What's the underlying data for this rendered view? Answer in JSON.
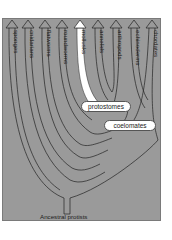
{
  "diagram": {
    "type": "phylogenetic-tree",
    "background_color": "#9a9a9a",
    "highlight_color": "#ffffff",
    "root_label": "Ancestral protists",
    "taxa": [
      {
        "name": "sponges",
        "x": 12,
        "highlighted": false
      },
      {
        "name": "cnidarians",
        "x": 28,
        "highlighted": false
      },
      {
        "name": "flatworms",
        "x": 45,
        "highlighted": false
      },
      {
        "name": "roundworms",
        "x": 62,
        "highlighted": false
      },
      {
        "name": "mollusks",
        "x": 80,
        "highlighted": true
      },
      {
        "name": "annelids",
        "x": 98,
        "highlighted": false
      },
      {
        "name": "arthropods",
        "x": 116,
        "highlighted": false
      },
      {
        "name": "echinoderms",
        "x": 134,
        "highlighted": false
      },
      {
        "name": "chordates",
        "x": 152,
        "highlighted": false
      }
    ],
    "clade_labels": [
      {
        "name": "protostomes"
      },
      {
        "name": "coelomates"
      }
    ]
  }
}
